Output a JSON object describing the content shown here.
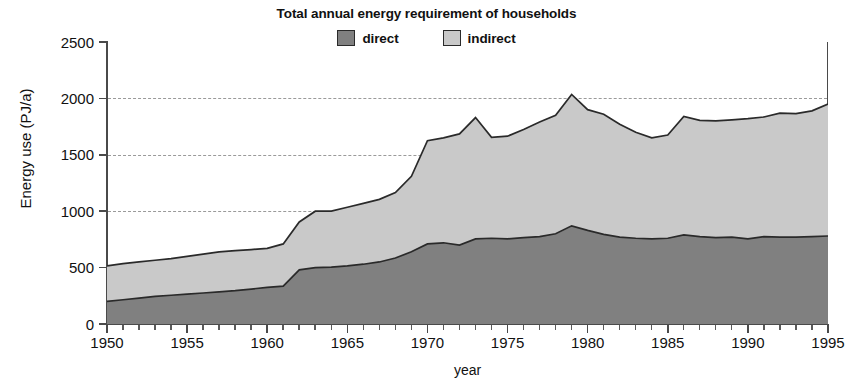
{
  "chart_data": {
    "type": "area",
    "title": "Total annual energy requirement of households",
    "xlabel": "year",
    "ylabel": "Energy use (PJ/a)",
    "xlim": [
      1950,
      1995
    ],
    "ylim": [
      0,
      2500
    ],
    "ytick_values": [
      0,
      500,
      1000,
      1500,
      2000,
      2500
    ],
    "ytick_labels": [
      "0",
      "500",
      "1000",
      "1500",
      "2000",
      "2500"
    ],
    "xtick_values": [
      1950,
      1955,
      1960,
      1965,
      1970,
      1975,
      1980,
      1985,
      1990,
      1995
    ],
    "xtick_labels": [
      "1950",
      "1955",
      "1960",
      "1965",
      "1970",
      "1975",
      "1980",
      "1985",
      "1990",
      "1995"
    ],
    "xtick_minor_step": 1,
    "grid": "horizontal-dashed",
    "stacked": true,
    "legend_position": "top-center",
    "colors": {
      "direct": "#808080",
      "indirect": "#c9c9c9",
      "outline": "#2a2a2a",
      "axis": "#4a4a4a",
      "gridline": "#9a9a9a"
    },
    "x": [
      1950,
      1951,
      1952,
      1953,
      1954,
      1955,
      1956,
      1957,
      1958,
      1959,
      1960,
      1961,
      1962,
      1963,
      1964,
      1965,
      1966,
      1967,
      1968,
      1969,
      1970,
      1971,
      1972,
      1973,
      1974,
      1975,
      1976,
      1977,
      1978,
      1979,
      1980,
      1981,
      1982,
      1983,
      1984,
      1985,
      1986,
      1987,
      1988,
      1989,
      1990,
      1991,
      1992,
      1993,
      1994,
      1995
    ],
    "series": [
      {
        "name": "direct",
        "label": "direct",
        "color": "#808080",
        "values": [
          200,
          215,
          230,
          245,
          255,
          265,
          275,
          285,
          295,
          310,
          325,
          335,
          480,
          500,
          505,
          515,
          530,
          550,
          585,
          640,
          710,
          720,
          700,
          755,
          760,
          755,
          765,
          775,
          800,
          870,
          830,
          795,
          770,
          760,
          755,
          760,
          790,
          775,
          765,
          770,
          755,
          775,
          770,
          770,
          775,
          780
        ]
      },
      {
        "name": "indirect",
        "label": "indirect",
        "color": "#c9c9c9",
        "values": [
          315,
          320,
          320,
          320,
          325,
          335,
          345,
          355,
          355,
          350,
          345,
          375,
          425,
          500,
          495,
          520,
          540,
          555,
          580,
          670,
          915,
          930,
          985,
          1075,
          895,
          910,
          960,
          1015,
          1050,
          1165,
          1070,
          1065,
          1000,
          940,
          895,
          915,
          1050,
          1030,
          1035,
          1040,
          1065,
          1060,
          1100,
          1095,
          1115,
          1170
        ]
      }
    ],
    "totals": [
      515,
      535,
      550,
      565,
      580,
      600,
      620,
      640,
      650,
      660,
      670,
      710,
      905,
      1000,
      1000,
      1035,
      1070,
      1105,
      1165,
      1310,
      1625,
      1650,
      1685,
      1830,
      1655,
      1665,
      1725,
      1790,
      1850,
      2035,
      1900,
      1860,
      1770,
      1700,
      1650,
      1675,
      1840,
      1805,
      1800,
      1810,
      1820,
      1835,
      1870,
      1865,
      1890,
      1950
    ]
  }
}
